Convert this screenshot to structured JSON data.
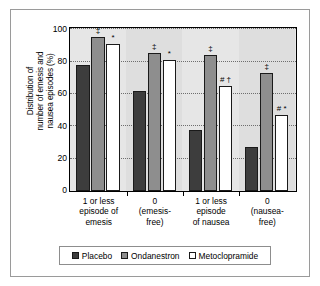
{
  "chart_data": {
    "type": "bar",
    "title": "",
    "xlabel": "",
    "ylabel": "Distribution of number of emesis and nausea episodes (%)",
    "ylabel_lines": [
      "Distribution of",
      "number of emesis and",
      "nausea episodes (%)"
    ],
    "ylim": [
      0,
      100
    ],
    "yticks": [
      0,
      20,
      40,
      60,
      80,
      100
    ],
    "grid": true,
    "legend_position": "bottom",
    "categories": [
      "1 or less episode of emesis",
      "0 (emesis-free)",
      "1 or less episode of nausea",
      "0 (nausea-free)"
    ],
    "category_lines": [
      [
        "1 or less",
        "episode of",
        "emesis"
      ],
      [
        "0",
        "(emesis-",
        "free)"
      ],
      [
        "1 or less",
        "episode",
        "of nausea"
      ],
      [
        "0",
        "(nausea-",
        "free)"
      ]
    ],
    "series": [
      {
        "name": "Placebo",
        "color": "#3d3d3d",
        "values": [
          78,
          62,
          38,
          27
        ]
      },
      {
        "name": "Ondanestron",
        "color": "#8e8e8e",
        "values": [
          95,
          85,
          84,
          73
        ]
      },
      {
        "name": "Metoclopramide",
        "color": "#ffffff",
        "values": [
          91,
          81,
          65,
          47
        ]
      }
    ],
    "annotations": [
      {
        "category_index": 0,
        "series_index": 1,
        "text": "‡",
        "value": 95
      },
      {
        "category_index": 0,
        "series_index": 2,
        "text": "*",
        "value": 91
      },
      {
        "category_index": 1,
        "series_index": 1,
        "text": "‡",
        "value": 85
      },
      {
        "category_index": 1,
        "series_index": 2,
        "text": "*",
        "value": 81
      },
      {
        "category_index": 2,
        "series_index": 1,
        "text": "‡",
        "value": 84
      },
      {
        "category_index": 2,
        "series_index": 2,
        "text": "# †",
        "value": 65
      },
      {
        "category_index": 3,
        "series_index": 1,
        "text": "‡",
        "value": 73
      },
      {
        "category_index": 3,
        "series_index": 2,
        "text": "# *",
        "value": 47
      }
    ]
  },
  "legend": {
    "items": [
      {
        "label": "Placebo"
      },
      {
        "label": "Ondanestron"
      },
      {
        "label": "Metoclopramide"
      }
    ]
  }
}
